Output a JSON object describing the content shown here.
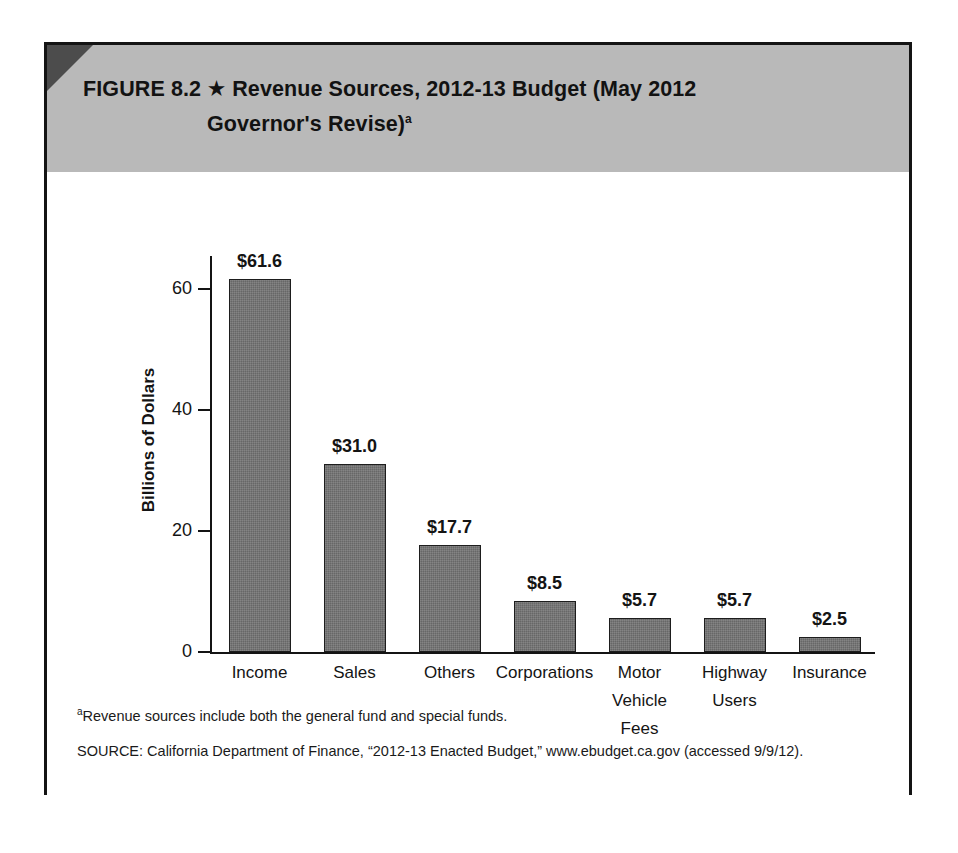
{
  "figure": {
    "label": "FIGURE 8.2",
    "star_icon": "star-icon",
    "star_glyph": "★",
    "title_line1": "Revenue Sources, 2012-13 Budget (May 2012",
    "title_line2": "Governor's Revise)",
    "title_superscript": "a",
    "header_color": "#b9b9b9",
    "frame_color": "#141414"
  },
  "chart_data": {
    "type": "bar",
    "title": "Revenue Sources, 2012-13 Budget (May 2012 Governor's Revise)",
    "xlabel": "",
    "ylabel": "Billions of Dollars",
    "ylim": [
      0,
      65
    ],
    "yticks": [
      0,
      20,
      40,
      60
    ],
    "ytick_labels": [
      "0",
      "20",
      "40",
      "60"
    ],
    "grid": false,
    "legend": false,
    "bar_color": "#676767",
    "categories": [
      "Income",
      "Sales",
      "Others",
      "Corporations",
      "Motor Vehicle Fees",
      "Highway Users",
      "Insurance"
    ],
    "category_lines": [
      [
        "Income"
      ],
      [
        "Sales"
      ],
      [
        "Others"
      ],
      [
        "Corporations"
      ],
      [
        "Motor",
        "Vehicle",
        "Fees"
      ],
      [
        "Highway",
        "Users"
      ],
      [
        "Insurance"
      ]
    ],
    "values": [
      61.6,
      31.0,
      17.7,
      8.5,
      5.7,
      5.7,
      2.5
    ],
    "value_labels": [
      "$61.6",
      "$31.0",
      "$17.7",
      "$8.5",
      "$5.7",
      "$5.7",
      "$2.5"
    ],
    "units": "Billions of Dollars"
  },
  "notes": {
    "footnote_marker": "a",
    "footnote_text": "Revenue sources include both the general fund and special funds.",
    "source": "SOURCE: California Department of Finance, “2012-13 Enacted Budget,” www.ebudget.ca.gov (accessed 9/9/12)."
  }
}
